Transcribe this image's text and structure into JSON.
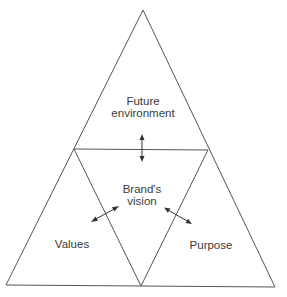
{
  "diagram": {
    "type": "triangle-of-triangles",
    "colors": {
      "background": "#ffffff",
      "lines": "#555555",
      "text": "#3a3a3a"
    },
    "sections": {
      "top": {
        "line1": "Future",
        "line2": "environment"
      },
      "center": {
        "line1": "Brand's",
        "line2": "vision"
      },
      "left": {
        "label": "Values"
      },
      "right": {
        "label": "Purpose"
      }
    },
    "relationships": [
      {
        "from": "Brand's vision",
        "to": "Future environment",
        "type": "bidirectional-arrow"
      },
      {
        "from": "Brand's vision",
        "to": "Values",
        "type": "bidirectional-arrow"
      },
      {
        "from": "Brand's vision",
        "to": "Purpose",
        "type": "bidirectional-arrow"
      }
    ]
  }
}
